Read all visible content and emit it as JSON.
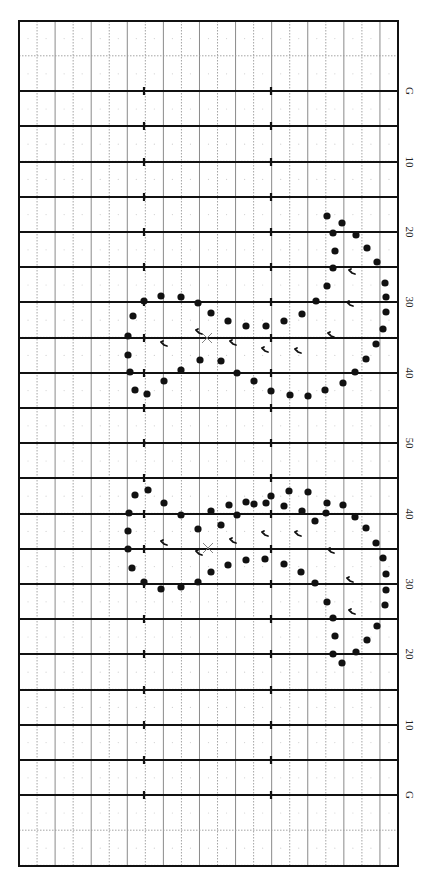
{
  "diagram": {
    "title": "",
    "type": "marching-band-drill-chart",
    "orientation": "rotated-90",
    "field": {
      "left": 19,
      "right": 398,
      "top": 21,
      "bottom": 866
    },
    "colors": {
      "border": "#111111",
      "yard_line": "#111111",
      "grid_solid": "#8a8a8a",
      "grid_dotted": "#9a9a9a",
      "dot": "#111111",
      "marker": "#111111",
      "center_x": "#777777"
    },
    "yard_lines": [
      {
        "label": "G",
        "y": 91
      },
      {
        "label": "",
        "y": 126
      },
      {
        "label": "10",
        "y": 162
      },
      {
        "label": "",
        "y": 197
      },
      {
        "label": "20",
        "y": 232
      },
      {
        "label": "",
        "y": 267
      },
      {
        "label": "30",
        "y": 302
      },
      {
        "label": "",
        "y": 338
      },
      {
        "label": "40",
        "y": 373
      },
      {
        "label": "",
        "y": 408
      },
      {
        "label": "50",
        "y": 443
      },
      {
        "label": "",
        "y": 478
      },
      {
        "label": "40",
        "y": 514
      },
      {
        "label": "",
        "y": 549
      },
      {
        "label": "30",
        "y": 584
      },
      {
        "label": "",
        "y": 619
      },
      {
        "label": "20",
        "y": 654
      },
      {
        "label": "",
        "y": 690
      },
      {
        "label": "10",
        "y": 725
      },
      {
        "label": "",
        "y": 760
      },
      {
        "label": "G",
        "y": 795
      }
    ],
    "hash_marks_x": [
      144,
      271
    ],
    "upper_figure": {
      "center_x": {
        "x": 207,
        "y": 338
      },
      "dots": [
        [
          327,
          216
        ],
        [
          342,
          223
        ],
        [
          333,
          233
        ],
        [
          356,
          235
        ],
        [
          335,
          251
        ],
        [
          367,
          248
        ],
        [
          333,
          268
        ],
        [
          377,
          262
        ],
        [
          327,
          286
        ],
        [
          385,
          283
        ],
        [
          316,
          301
        ],
        [
          386,
          297
        ],
        [
          386,
          312
        ],
        [
          383,
          329
        ],
        [
          376,
          344
        ],
        [
          366,
          359
        ],
        [
          355,
          372
        ],
        [
          343,
          383
        ],
        [
          325,
          390
        ],
        [
          308,
          396
        ],
        [
          290,
          395
        ],
        [
          271,
          391
        ],
        [
          254,
          381
        ],
        [
          237,
          373
        ],
        [
          221,
          361
        ],
        [
          200,
          360
        ],
        [
          302,
          314
        ],
        [
          284,
          321
        ],
        [
          266,
          326
        ],
        [
          246,
          326
        ],
        [
          228,
          321
        ],
        [
          211,
          313
        ],
        [
          198,
          303
        ],
        [
          181,
          297
        ],
        [
          161,
          296
        ],
        [
          144,
          301
        ],
        [
          133,
          316
        ],
        [
          128,
          336
        ],
        [
          128,
          355
        ],
        [
          130,
          372
        ],
        [
          135,
          390
        ],
        [
          147,
          394
        ],
        [
          164,
          381
        ],
        [
          181,
          370
        ]
      ],
      "markers": [
        [
          164,
          344
        ],
        [
          199,
          332
        ],
        [
          233,
          343
        ],
        [
          265,
          350
        ],
        [
          298,
          351
        ],
        [
          352,
          272
        ],
        [
          350,
          304
        ],
        [
          331,
          335
        ]
      ]
    },
    "lower_figure": {
      "center_x": {
        "x": 208,
        "y": 548
      },
      "dots": [
        [
          327,
          503
        ],
        [
          308,
          492
        ],
        [
          289,
          491
        ],
        [
          271,
          496
        ],
        [
          254,
          504
        ],
        [
          237,
          515
        ],
        [
          221,
          525
        ],
        [
          198,
          529
        ],
        [
          211,
          511
        ],
        [
          229,
          505
        ],
        [
          246,
          502
        ],
        [
          266,
          503
        ],
        [
          284,
          506
        ],
        [
          302,
          511
        ],
        [
          315,
          521
        ],
        [
          315,
          583
        ],
        [
          301,
          572
        ],
        [
          284,
          564
        ],
        [
          265,
          559
        ],
        [
          246,
          560
        ],
        [
          228,
          565
        ],
        [
          211,
          572
        ],
        [
          198,
          582
        ],
        [
          326,
          513
        ],
        [
          343,
          505
        ],
        [
          355,
          517
        ],
        [
          366,
          528
        ],
        [
          376,
          543
        ],
        [
          383,
          558
        ],
        [
          386,
          574
        ],
        [
          386,
          590
        ],
        [
          385,
          605
        ],
        [
          377,
          626
        ],
        [
          367,
          640
        ],
        [
          356,
          652
        ],
        [
          342,
          663
        ],
        [
          333,
          654
        ],
        [
          335,
          636
        ],
        [
          333,
          618
        ],
        [
          327,
          602
        ],
        [
          148,
          490
        ],
        [
          135,
          495
        ],
        [
          164,
          503
        ],
        [
          181,
          515
        ],
        [
          129,
          513
        ],
        [
          128,
          531
        ],
        [
          128,
          549
        ],
        [
          132,
          568
        ],
        [
          144,
          582
        ],
        [
          161,
          589
        ],
        [
          181,
          587
        ]
      ],
      "markers": [
        [
          164,
          543
        ],
        [
          199,
          553
        ],
        [
          233,
          541
        ],
        [
          265,
          534
        ],
        [
          298,
          534
        ],
        [
          350,
          580
        ],
        [
          352,
          612
        ],
        [
          331,
          551
        ]
      ]
    }
  }
}
